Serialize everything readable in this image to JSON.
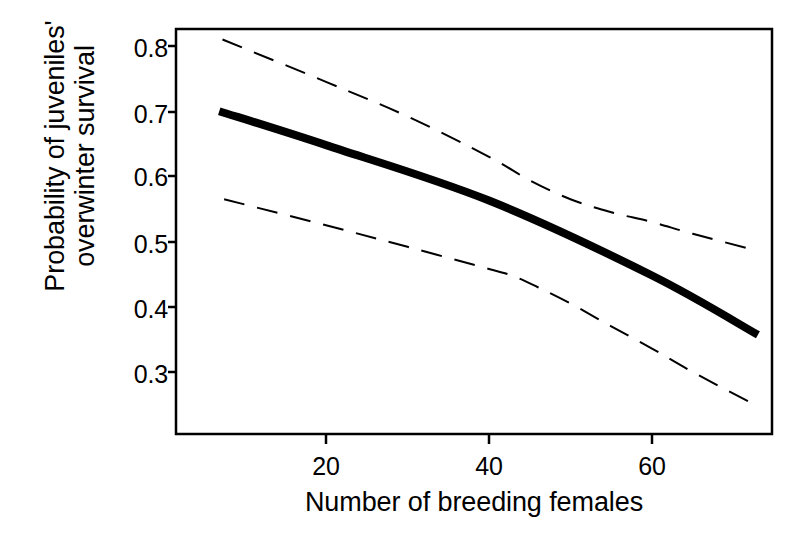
{
  "chart_data": {
    "type": "line",
    "title": "",
    "xlabel": "Number of breeding females",
    "ylabel": "Probability of juveniles'\novervinter survival",
    "ylabel_line1": "Probability of juveniles'",
    "ylabel_line2": "overwinter survival",
    "xlim": [
      5,
      74
    ],
    "ylim": [
      0.232,
      0.826
    ],
    "grid": false,
    "legend": "none",
    "xticks": [
      20,
      40,
      60
    ],
    "xtick_labels": [
      "20",
      "40",
      "60"
    ],
    "yticks": [
      0.3,
      0.4,
      0.5,
      0.6,
      0.7,
      0.8
    ],
    "ytick_labels": [
      "0.3",
      "0.4",
      "0.5",
      "0.6",
      "0.7",
      "0.8"
    ],
    "series": [
      {
        "name": "Fitted probability of overwinter survival",
        "style": "solid",
        "linewidth": 8,
        "color": "#000000",
        "x": [
          6.9,
          20,
          40,
          60,
          73.0
        ],
        "values": [
          0.7,
          0.648,
          0.563,
          0.448,
          0.357
        ]
      },
      {
        "name": "Upper 95% confidence limit",
        "style": "dashed",
        "linewidth": 2,
        "color": "#000000",
        "x": [
          7.3,
          20,
          30,
          40,
          45,
          50,
          55,
          60,
          65,
          72.6
        ],
        "values": [
          0.81,
          0.745,
          0.692,
          0.63,
          0.594,
          0.565,
          0.545,
          0.53,
          0.512,
          0.487
        ]
      },
      {
        "name": "Lower 95% confidence limit",
        "style": "dashed",
        "linewidth": 2,
        "color": "#000000",
        "x": [
          7.5,
          20,
          30,
          40,
          43,
          46,
          50,
          55,
          60,
          65,
          72.1
        ],
        "values": [
          0.565,
          0.525,
          0.492,
          0.458,
          0.447,
          0.43,
          0.405,
          0.37,
          0.336,
          0.3,
          0.253
        ]
      }
    ]
  },
  "axes": {
    "frame_color": "#000000",
    "background": "#ffffff"
  }
}
